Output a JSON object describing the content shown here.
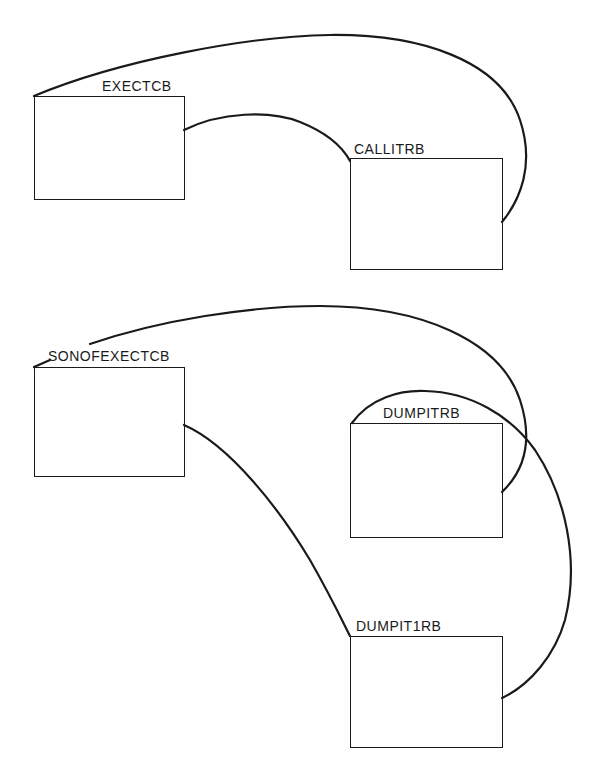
{
  "diagram": {
    "type": "control-block linkage diagram",
    "colors": {
      "line": "#1a1a1a",
      "background": "#ffffff"
    },
    "nodes": [
      {
        "id": "exectcb",
        "label": "EXECTCB",
        "x": 34,
        "y": 96,
        "w": 151,
        "h": 104,
        "label_x": 102,
        "label_y": 79
      },
      {
        "id": "callitrb",
        "label": "CALLITRB",
        "x": 350,
        "y": 158,
        "w": 153,
        "h": 112,
        "label_x": 354,
        "label_y": 142
      },
      {
        "id": "sonofexectcb",
        "label": "SONOFEXECTCB",
        "x": 34,
        "y": 367,
        "w": 151,
        "h": 110,
        "label_x": 48,
        "label_y": 349
      },
      {
        "id": "dumpitrb",
        "label": "DUMPITRB",
        "x": 350,
        "y": 423,
        "w": 153,
        "h": 115,
        "label_x": 383,
        "label_y": 406
      },
      {
        "id": "dumpit1rb",
        "label": "DUMPIT1RB",
        "x": 350,
        "y": 636,
        "w": 153,
        "h": 112,
        "label_x": 356,
        "label_y": 619
      }
    ],
    "edges": [
      {
        "from": "exectcb",
        "to": "callitrb",
        "kind": "outer-loop"
      },
      {
        "from": "exectcb",
        "to": "callitrb",
        "kind": "direct"
      },
      {
        "from": "sonofexectcb",
        "to": "dumpitrb",
        "kind": "outer-loop"
      },
      {
        "from": "sonofexectcb",
        "to": "dumpit1rb",
        "kind": "direct"
      },
      {
        "from": "dumpitrb",
        "to": "dumpit1rb",
        "kind": "arch"
      }
    ]
  }
}
